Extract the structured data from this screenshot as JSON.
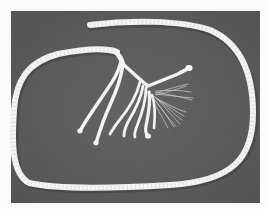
{
  "image": {
    "description": "Grayscale photograph of a white twisted rope forming a loop on a dark gray surface; one end is unraveled into several strands with frayed fibers",
    "subject": "rope with unraveled end",
    "colors": {
      "border": "#fbfbfb",
      "background": "#5f5f5f",
      "background_dark": "#525252",
      "rope": "#f4f4f4",
      "rope_shadow": "#3e3e3e",
      "fibers": "#d8d8d8"
    },
    "photo_bounds": {
      "x": 11,
      "y": 11,
      "width": 249,
      "height": 192
    }
  }
}
